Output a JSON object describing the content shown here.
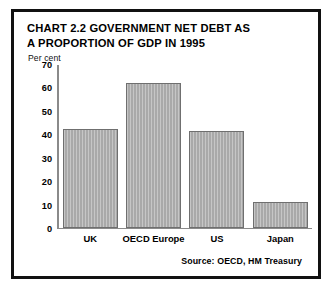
{
  "card": {
    "border_color": "#111111",
    "background": "#ffffff"
  },
  "title": {
    "line1": "CHART 2.2 GOVERNMENT NET DEBT AS",
    "line2": "A PROPORTION OF GDP IN 1995"
  },
  "unit_label": "Per cent",
  "source_note": "Source: OECD, HM Treasury",
  "chart_data": {
    "type": "bar",
    "title": "CHART 2.2 GOVERNMENT NET DEBT AS A PROPORTION OF GDP IN 1995",
    "xlabel": "",
    "ylabel": "Per cent",
    "ylim": [
      0,
      70
    ],
    "yticks": [
      0,
      10,
      20,
      30,
      40,
      50,
      60,
      70
    ],
    "ytick_labels": [
      "0",
      "10",
      "20",
      "30",
      "40",
      "50",
      "60",
      "70"
    ],
    "grid": false,
    "legend": false,
    "categories": [
      "UK",
      "OECD Europe",
      "US",
      "Japan"
    ],
    "values": [
      42,
      61.5,
      41,
      11
    ],
    "bar_fill_color": "#a9a9a9",
    "bar_edge_color": "#6f6f6f",
    "bar_pattern": "vertical-pinstripe",
    "axis_color": "#8a8a8a",
    "source": "Source: OECD, HM Treasury"
  }
}
